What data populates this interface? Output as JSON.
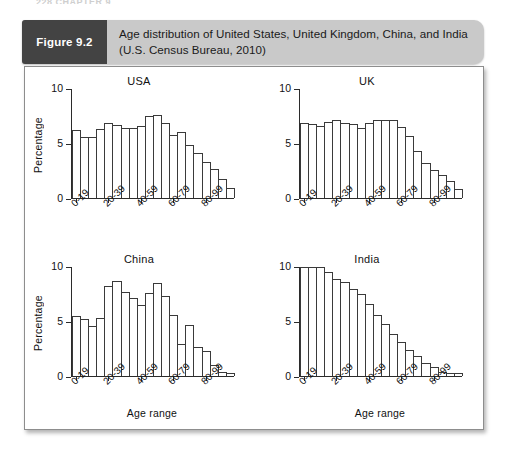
{
  "running_head": "228  CHAPTER 9",
  "figure": {
    "tag": "Figure 9.2",
    "caption": "Age distribution of United States, United Kingdom, China, and India (U.S. Census Bureau, 2010)"
  },
  "chart_data": [
    {
      "type": "bar",
      "title": "USA",
      "xlabel": "",
      "ylabel": "Percentage",
      "ylim": [
        0,
        10
      ],
      "yticks": [
        0,
        5,
        10
      ],
      "ytick_labels": [
        "0",
        "5",
        "10"
      ],
      "grid": false,
      "legend": null,
      "categories": [
        "0-4",
        "5-9",
        "10-14",
        "15-19",
        "20-24",
        "25-29",
        "30-34",
        "35-39",
        "40-44",
        "45-49",
        "50-54",
        "55-59",
        "60-64",
        "65-69",
        "70-74",
        "75-79",
        "80-84",
        "85-89",
        "90-94",
        "95-99"
      ],
      "xtick_labels": [
        "0-19",
        "20-39",
        "40-59",
        "60-79",
        "80-99"
      ],
      "values": [
        6.2,
        5.6,
        5.6,
        6.3,
        6.9,
        6.7,
        6.4,
        6.4,
        6.6,
        7.5,
        7.6,
        6.9,
        5.8,
        6.1,
        4.9,
        4.1,
        3.3,
        2.7,
        1.7,
        0.9
      ]
    },
    {
      "type": "bar",
      "title": "UK",
      "xlabel": "",
      "ylabel": "",
      "ylim": [
        0,
        10
      ],
      "yticks": [
        0,
        5,
        10
      ],
      "ytick_labels": [
        "0",
        "5",
        "10"
      ],
      "grid": false,
      "legend": null,
      "categories": [
        "0-4",
        "5-9",
        "10-14",
        "15-19",
        "20-24",
        "25-29",
        "30-34",
        "35-39",
        "40-44",
        "45-49",
        "50-54",
        "55-59",
        "60-64",
        "65-69",
        "70-74",
        "75-79",
        "80-84",
        "85-89",
        "90-94",
        "95-99"
      ],
      "xtick_labels": [
        "0-19",
        "20-39",
        "40-59",
        "60-79",
        "80-99"
      ],
      "values": [
        6.9,
        6.8,
        6.6,
        7.0,
        7.2,
        6.9,
        6.8,
        6.4,
        6.9,
        7.2,
        7.2,
        7.2,
        6.5,
        5.7,
        4.3,
        3.2,
        2.6,
        2.1,
        1.6,
        0.8
      ]
    },
    {
      "type": "bar",
      "title": "China",
      "xlabel": "Age range",
      "ylabel": "Percentage",
      "ylim": [
        0,
        10
      ],
      "yticks": [
        0,
        5,
        10
      ],
      "ytick_labels": [
        "0",
        "5",
        "10"
      ],
      "grid": false,
      "legend": null,
      "categories": [
        "0-4",
        "5-9",
        "10-14",
        "15-19",
        "20-24",
        "25-29",
        "30-34",
        "35-39",
        "40-44",
        "45-49",
        "50-54",
        "55-59",
        "60-64",
        "65-69",
        "70-74",
        "75-79",
        "80-84",
        "85-89",
        "90-94",
        "95-99"
      ],
      "xtick_labels": [
        "0-19",
        "20-39",
        "40-59",
        "60-79",
        "80-99"
      ],
      "values": [
        5.5,
        5.2,
        4.6,
        5.3,
        8.3,
        8.7,
        7.7,
        7.2,
        6.5,
        7.6,
        8.5,
        7.3,
        5.6,
        2.9,
        4.7,
        2.7,
        2.3,
        1.0,
        0.4,
        0.3
      ]
    },
    {
      "type": "bar",
      "title": "India",
      "xlabel": "Age range",
      "ylabel": "",
      "ylim": [
        0,
        10
      ],
      "yticks": [
        0,
        5,
        10
      ],
      "ytick_labels": [
        "0",
        "5",
        "10"
      ],
      "grid": false,
      "legend": null,
      "categories": [
        "0-4",
        "5-9",
        "10-14",
        "15-19",
        "20-24",
        "25-29",
        "30-34",
        "35-39",
        "40-44",
        "45-49",
        "50-54",
        "55-59",
        "60-64",
        "65-69",
        "70-74",
        "75-79",
        "80-84",
        "85-89",
        "90-94",
        "95-99"
      ],
      "xtick_labels": [
        "0-19",
        "20-39",
        "40-59",
        "60-79",
        "80-99"
      ],
      "values": [
        10.0,
        10.0,
        10.0,
        9.5,
        8.9,
        8.6,
        8.0,
        7.5,
        6.6,
        5.6,
        4.8,
        3.9,
        3.1,
        2.4,
        1.8,
        1.2,
        0.8,
        0.4,
        0.3,
        0.25
      ]
    }
  ]
}
